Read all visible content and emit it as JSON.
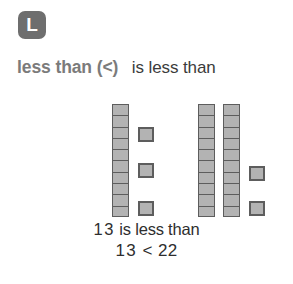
{
  "badge": {
    "letter": "L",
    "color": "#6e6e6e",
    "text_color": "#ffffff"
  },
  "heading": {
    "term": "less than (<)",
    "definition": "is less than",
    "term_color": "#7b7b7b",
    "definition_color": "#3b3b3b"
  },
  "blocks": {
    "block_fill": "#b3b3b3",
    "block_border": "#5d5d5d",
    "left_group": {
      "label": "13",
      "tens": 1,
      "ones": 3,
      "total": 13,
      "rods": [
        10
      ],
      "unit_count": 3
    },
    "right_group": {
      "label": "22",
      "tens": 2,
      "ones": 2,
      "total": 22,
      "rods": [
        10,
        10
      ],
      "unit_count": 2
    }
  },
  "sentence": {
    "words_line": "13 is less than",
    "words_line_parts": {
      "first_number": "13",
      "phrase": "is less than"
    },
    "symbol_line": "13 < 22",
    "symbol_line_parts": {
      "left": "13",
      "operator": "<",
      "right": "22"
    }
  }
}
